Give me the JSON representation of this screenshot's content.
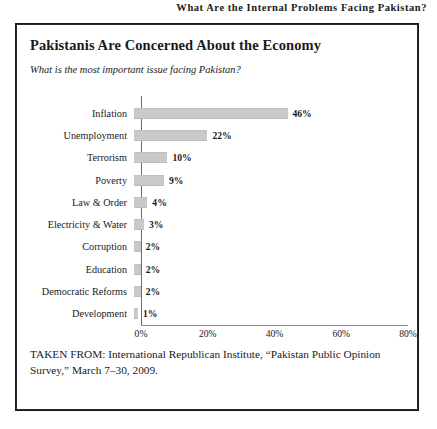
{
  "running_head": "What Are the Internal Problems Facing Pakistan?",
  "figure": {
    "title": "Pakistanis Are Concerned About the Economy",
    "subtitle": "What is the most important issue facing Pakistan?",
    "source_note": "TAKEN FROM: International Republican Institute, “Pakistan Public Opinion Survey,” March 7–30, 2009."
  },
  "chart_data": {
    "type": "bar",
    "orientation": "horizontal",
    "title": "Pakistanis Are Concerned About the Economy",
    "subtitle": "What is the most important issue facing Pakistan?",
    "xlabel": "",
    "ylabel": "",
    "xlim": [
      0,
      80
    ],
    "grid": false,
    "legend": null,
    "tick_labels": [
      "0%",
      "20%",
      "40%",
      "60%",
      "80%"
    ],
    "ticks": [
      0,
      20,
      40,
      60,
      80
    ],
    "bar_color": "#c9c9c9",
    "categories": [
      "Inflation",
      "Unemployment",
      "Terrorism",
      "Poverty",
      "Law & Order",
      "Electricity & Water",
      "Corruption",
      "Education",
      "Democratic Reforms",
      "Development"
    ],
    "values": [
      46,
      22,
      10,
      9,
      4,
      3,
      2,
      2,
      2,
      1
    ],
    "data_labels": [
      "46%",
      "22%",
      "10%",
      "9%",
      "4%",
      "3%",
      "2%",
      "2%",
      "2%",
      "1%"
    ]
  }
}
